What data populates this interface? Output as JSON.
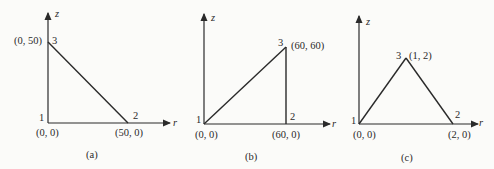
{
  "figures": [
    {
      "caption": "(a)",
      "axis_r": "r",
      "axis_z": "z",
      "nodes": [
        {
          "id": "1",
          "coord": "(0, 0)"
        },
        {
          "id": "2",
          "coord": "(50, 0)"
        },
        {
          "id": "3",
          "coord": "(0, 50)"
        }
      ]
    },
    {
      "caption": "(b)",
      "axis_r": "r",
      "axis_z": "z",
      "nodes": [
        {
          "id": "1",
          "coord": "(0, 0)"
        },
        {
          "id": "2",
          "coord": "(60, 0)"
        },
        {
          "id": "3",
          "coord": "(60, 60)"
        }
      ]
    },
    {
      "caption": "(c)",
      "axis_r": "r",
      "axis_z": "z",
      "nodes": [
        {
          "id": "1",
          "coord": "(0, 0)"
        },
        {
          "id": "2",
          "coord": "(2, 0)"
        },
        {
          "id": "3",
          "coord": "(1, 2)"
        }
      ]
    }
  ],
  "colors": {
    "line": "#2a2a2a",
    "background": "#fbfbf9"
  }
}
